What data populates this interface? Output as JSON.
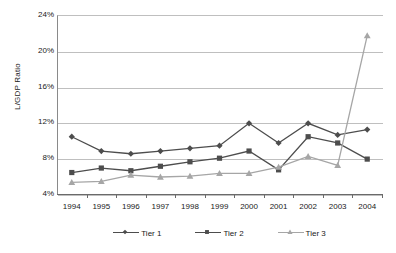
{
  "chart_data": {
    "type": "line",
    "title": "",
    "subtitle": "",
    "xlabel": "",
    "ylabel": "L/GDP Ratio",
    "categories": [
      "1994",
      "1995",
      "1996",
      "1997",
      "1998",
      "1999",
      "2000",
      "2001",
      "2002",
      "2003",
      "2004"
    ],
    "x": [
      1994,
      1995,
      1996,
      1997,
      1998,
      1999,
      2000,
      2001,
      2002,
      2003,
      2004
    ],
    "ylim": [
      4,
      24
    ],
    "ytick_labels": [
      "4%",
      "8%",
      "12%",
      "16%",
      "20%",
      "24%"
    ],
    "ytick_values": [
      4,
      8,
      12,
      16,
      20,
      24
    ],
    "yaxis_unit": "%",
    "grid": true,
    "legend_position": "bottom",
    "series": [
      {
        "name": "Tier 1",
        "marker": "diamond",
        "color": "#4d4d4d",
        "values": [
          10.4,
          8.8,
          8.5,
          8.8,
          9.1,
          9.4,
          11.9,
          9.7,
          11.9,
          10.6,
          11.2
        ]
      },
      {
        "name": "Tier 2",
        "marker": "square",
        "color": "#4d4d4d",
        "values": [
          6.4,
          6.9,
          6.6,
          7.1,
          7.6,
          8.0,
          8.8,
          6.7,
          10.4,
          9.7,
          7.9
        ]
      },
      {
        "name": "Tier 3",
        "marker": "triangle",
        "color": "#a6a6a6",
        "values": [
          5.3,
          5.4,
          6.1,
          5.9,
          6.0,
          6.3,
          6.3,
          7.0,
          8.2,
          7.2,
          21.7
        ]
      }
    ]
  },
  "colors": {
    "tier1": "#4d4d4d",
    "tier2": "#4d4d4d",
    "tier3": "#a6a6a6",
    "grid": "#bfbfbf",
    "axis": "#6a6a6a",
    "text": "#1a1a1a",
    "background": "#ffffff"
  }
}
